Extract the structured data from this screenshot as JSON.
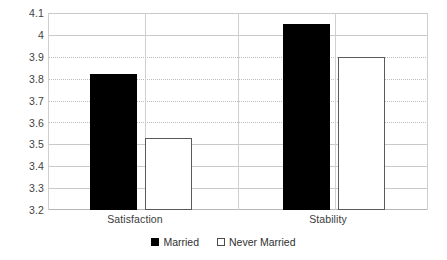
{
  "chart_data": {
    "type": "bar",
    "title": "",
    "subtitle": "",
    "xlabel": "",
    "ylabel": "",
    "categories": [
      "Satisfaction",
      "Stability"
    ],
    "series": [
      {
        "name": "Married",
        "values": [
          3.82,
          4.05
        ],
        "color": "#000000",
        "style": "filled"
      },
      {
        "name": "Never Married",
        "values": [
          3.53,
          3.9
        ],
        "color": "#ffffff",
        "style": "hollow-outlined"
      }
    ],
    "ylim": [
      3.2,
      4.1
    ],
    "yticks": [
      "3.2",
      "3.3",
      "3.4",
      "3.5",
      "3.6",
      "3.7",
      "3.8",
      "3.9",
      "4",
      "4.1"
    ],
    "ytick_values": [
      3.2,
      3.3,
      3.4,
      3.5,
      3.6,
      3.7,
      3.8,
      3.9,
      4.0,
      4.1
    ],
    "grid": "horizontal",
    "legend_position": "bottom",
    "annotations": []
  },
  "legend": {
    "items": [
      {
        "label": "Married",
        "swatch": "filled-square-icon"
      },
      {
        "label": "Never Married",
        "swatch": "hollow-square-icon"
      }
    ]
  },
  "axis": {
    "y_labels": [
      "4.1",
      "4",
      "3.9",
      "3.8",
      "3.7",
      "3.6",
      "3.5",
      "3.4",
      "3.3",
      "3.2"
    ],
    "x_labels": [
      "Satisfaction",
      "Stability"
    ]
  },
  "colors": {
    "married_bar": "#000000",
    "never_married_bar": "#ffffff",
    "never_married_border": "#5a5a5a",
    "gridline": "#c9c9c9",
    "text": "#3b3b3b",
    "background": "#ffffff"
  }
}
